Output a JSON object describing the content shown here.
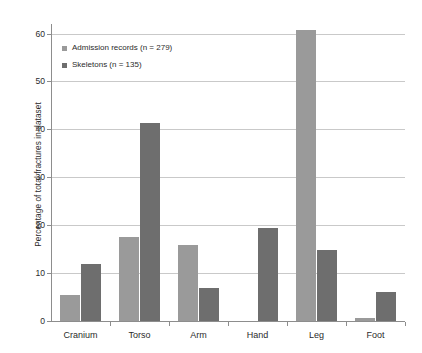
{
  "chart_data": {
    "type": "bar",
    "title": "",
    "xlabel": "",
    "ylabel": "Percentage of total fractures in dataset",
    "categories": [
      "Cranium",
      "Torso",
      "Arm",
      "Hand",
      "Leg",
      "Foot"
    ],
    "series": [
      {
        "name": "Admission records (n = 279)",
        "color": "#9a9a9a",
        "values": [
          5.4,
          17.6,
          15.8,
          0,
          60.7,
          0.7
        ]
      },
      {
        "name": "Skeletons (n = 135)",
        "color": "#6e6e6e",
        "values": [
          11.8,
          41.4,
          6.8,
          19.4,
          14.9,
          6.0
        ]
      }
    ],
    "ylim": [
      0,
      62
    ],
    "yticks": [
      0,
      10,
      20,
      30,
      40,
      50,
      60
    ],
    "ytick_labels": [
      "0",
      "10",
      "20",
      "30",
      "40",
      "50",
      "60"
    ],
    "grid": true,
    "legend_position": "upper-left"
  },
  "axis": {
    "line_color": "#8d8d8d",
    "grid_color": "#c9c9c9"
  }
}
